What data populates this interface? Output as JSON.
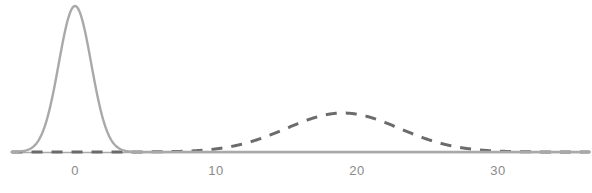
{
  "chart_data": {
    "type": "line",
    "title": "",
    "subtitle": "",
    "xlabel": "",
    "ylabel": "",
    "xlim": [
      -4.5,
      36.5
    ],
    "ylim": [
      0,
      1.06
    ],
    "grid": false,
    "legend": null,
    "axis": {
      "baseline_visible": true,
      "baseline_color": "#aaaaaa",
      "ticks": [
        {
          "value": 0,
          "label": "0",
          "x_px": 75
        },
        {
          "value": 10,
          "label": "10",
          "x_px": 216
        },
        {
          "value": 20,
          "label": "20",
          "x_px": 357
        },
        {
          "value": 30,
          "label": "30",
          "x_px": 498
        }
      ],
      "tick_labels": [
        "0",
        "10",
        "20",
        "30"
      ],
      "px_per_unit": 14.1,
      "baseline_y_px": 152
    },
    "series": [
      {
        "name": "narrow-peak",
        "style": "solid",
        "color": "#a9a9a9",
        "linewidth": 2.4,
        "distribution": "gaussian",
        "mean": 0,
        "sigma": 1.15,
        "peak_height": 1.0,
        "peak_x": 0,
        "peak_y_px": 6,
        "x_range": [
          -4.5,
          36.5
        ]
      },
      {
        "name": "broad-peak",
        "style": "dashed",
        "color": "#6b6b6b",
        "linewidth": 3.0,
        "dash_pattern": "11 9",
        "distribution": "gaussian",
        "mean": 19,
        "sigma": 4.0,
        "peak_height": 0.27,
        "peak_x": 19,
        "peak_y_px": 113,
        "x_range": [
          -4.5,
          36.5
        ]
      }
    ]
  },
  "figure": {
    "background_color": "#ffffff",
    "width_px": 592,
    "height_px": 193
  }
}
